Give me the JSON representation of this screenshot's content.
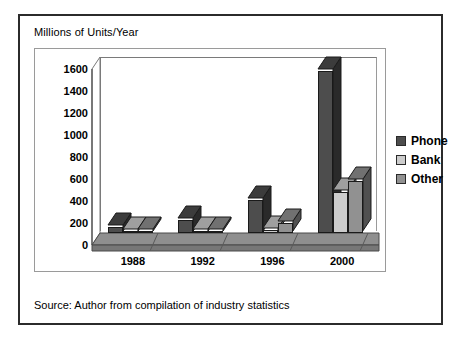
{
  "figure": {
    "title": "Millions of Units/Year",
    "source_caption": "Source:  Author from compilation of industry statistics"
  },
  "legend": {
    "position": "right",
    "items": [
      {
        "label": "Phone",
        "color": "#4d4d4d"
      },
      {
        "label": "Bank",
        "color": "#cccccc"
      },
      {
        "label": "Other",
        "color": "#919191"
      }
    ]
  },
  "chart_data": {
    "type": "bar",
    "title": "Millions of Units/Year",
    "subtitle": "",
    "xlabel": "",
    "ylabel": "Millions of Units/Year",
    "categories": [
      "1988",
      "1992",
      "1996",
      "2000"
    ],
    "series": [
      {
        "name": "Phone",
        "color": "#4d4d4d",
        "values": [
          55,
          120,
          300,
          1470
        ]
      },
      {
        "name": "Bank",
        "color": "#cccccc",
        "values": [
          3,
          5,
          25,
          370
        ]
      },
      {
        "name": "Other",
        "color": "#919191",
        "values": [
          5,
          8,
          90,
          470
        ]
      }
    ],
    "ylim": [
      0,
      1600
    ],
    "yticks": [
      0,
      200,
      400,
      600,
      800,
      1000,
      1200,
      1400,
      1600
    ],
    "ytick_labels": [
      "0",
      "200",
      "400",
      "600",
      "800",
      "1000",
      "1200",
      "1400",
      "1600"
    ],
    "grid": true,
    "grid_axis": "y",
    "legend_position": "right",
    "style": "3d-column",
    "annotations": [
      "Source:  Author from compilation of industry statistics"
    ]
  }
}
